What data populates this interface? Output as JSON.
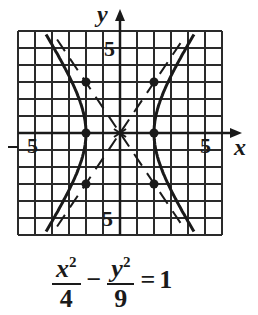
{
  "chart_data": {
    "type": "diagram",
    "equation": {
      "term1_numerator": "x",
      "term1_exponent": "2",
      "term1_denominator": "4",
      "operator": "−",
      "term2_numerator": "y",
      "term2_exponent": "2",
      "term2_denominator": "9",
      "equals": "=",
      "rhs": "1"
    },
    "axes": {
      "x_label": "x",
      "y_label": "y",
      "x_range": [
        -6,
        6
      ],
      "y_range": [
        -6,
        6
      ],
      "grid": true,
      "grid_step": 1,
      "tick_labels": {
        "x_neg": "5",
        "x_pos": "5",
        "y_pos": "5",
        "y_neg": "5"
      }
    },
    "vertices": [
      [
        -2,
        0
      ],
      [
        2,
        0
      ]
    ],
    "box_corners": [
      [
        -2,
        3
      ],
      [
        2,
        3
      ],
      [
        -2,
        -3
      ],
      [
        2,
        -3
      ]
    ],
    "center": [
      0,
      0
    ],
    "asymptotes": [
      "y = 1.5x",
      "y = -1.5x"
    ],
    "a": 2,
    "b": 3,
    "colors": {
      "ink": "#1a1a1a",
      "grid": "#2a2a2a",
      "background": "#ffffff"
    }
  }
}
